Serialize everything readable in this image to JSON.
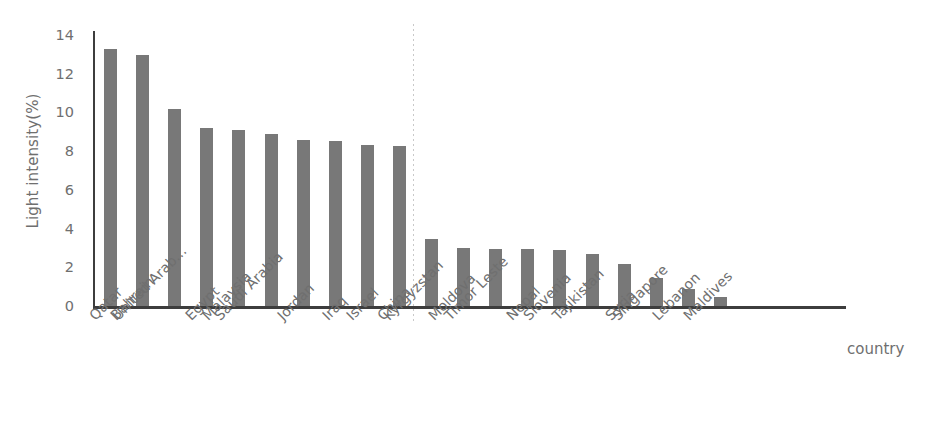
{
  "chart_data": {
    "type": "bar",
    "title": "",
    "xlabel": "country",
    "ylabel": "Light intensity(%)",
    "ylim": [
      0,
      14
    ],
    "ytick_step": 2,
    "yticks": [
      0,
      2,
      4,
      6,
      8,
      10,
      12,
      14
    ],
    "ytick_labels": [
      "0",
      "2",
      "4",
      "6",
      "8",
      "10",
      "12",
      "14"
    ],
    "grid": false,
    "legend": "none",
    "bar_color": "#787878",
    "axis_color": "#3d3d3d",
    "text_color": "#6f6f6f",
    "divider_color": "#c9c9c9",
    "annotations": [
      {
        "name": "group-divider",
        "type": "vertical-dotted-line",
        "after_category": "China",
        "before_category": "Kyrgyzstan"
      }
    ],
    "categories": [
      "Qatar",
      "Bahrain",
      "United Arab...",
      "Egypt",
      "Malaysia",
      "Saudi Arabia",
      "Jordan",
      "Iraq",
      "Israel",
      "China",
      "Kyrgyzstan",
      "Moldova",
      "Timor Leste",
      "Nepal",
      "Slovenia",
      "Tajikistan",
      "Syria",
      "Singapore",
      "Lebanon",
      "Maldives"
    ],
    "values": [
      13.3,
      12.95,
      10.2,
      9.2,
      9.1,
      8.9,
      8.6,
      8.5,
      8.3,
      8.25,
      3.45,
      3.0,
      2.95,
      2.95,
      2.9,
      2.7,
      2.15,
      1.45,
      0.9,
      0.45
    ]
  }
}
